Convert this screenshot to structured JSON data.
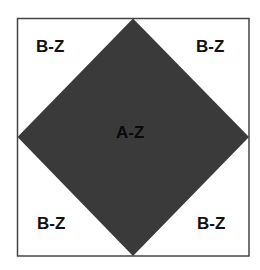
{
  "diagram": {
    "outer_square": {
      "left": 17,
      "top": 18,
      "right": 249,
      "bottom": 256,
      "stroke": "#444444",
      "fill": "#ffffff"
    },
    "diamond": {
      "points": [
        [
          133,
          18
        ],
        [
          249,
          137
        ],
        [
          133,
          256
        ],
        [
          17,
          137
        ]
      ],
      "fill": "#3a3a3a"
    },
    "labels": {
      "center": "A-Z",
      "top_left": "B-Z",
      "top_right": "B-Z",
      "bottom_left": "B-Z",
      "bottom_right": "B-Z"
    }
  }
}
